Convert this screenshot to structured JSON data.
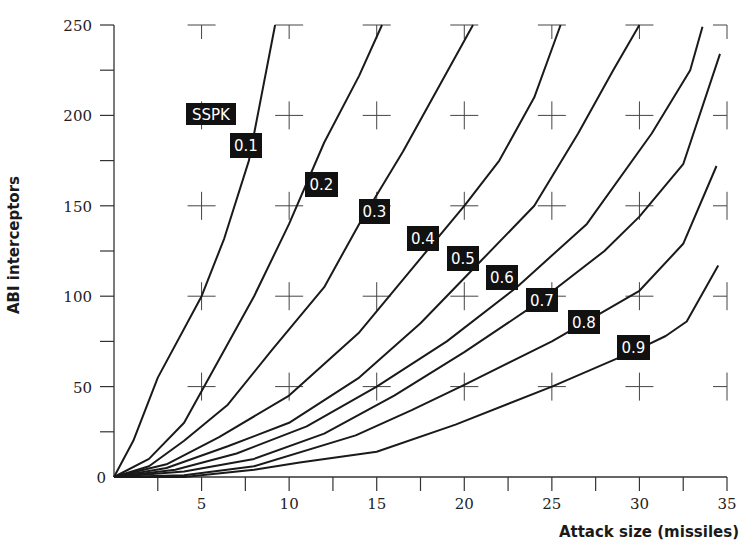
{
  "chart_data": {
    "type": "line",
    "title": "",
    "xlabel": "Attack size (missiles)",
    "ylabel": "ABI interceptors",
    "xlim": [
      0,
      35
    ],
    "ylim": [
      0,
      250
    ],
    "x_ticks": [
      0,
      5,
      10,
      15,
      20,
      25,
      30,
      35
    ],
    "y_ticks": [
      0,
      50,
      100,
      150,
      200,
      250
    ],
    "x_minor_tick_step": 2.5,
    "y_minor_tick_step": 25,
    "grid": "cross markers at major ticks",
    "legend": {
      "title": "SSPK",
      "position": "inline labels on curves"
    },
    "series": [
      {
        "name": "0.1",
        "points": [
          [
            0,
            0
          ],
          [
            1.1,
            20
          ],
          [
            2.5,
            55
          ],
          [
            5,
            100
          ],
          [
            6.3,
            132
          ],
          [
            7.7,
            175
          ],
          [
            9.2,
            250
          ]
        ]
      },
      {
        "name": "0.2",
        "points": [
          [
            0,
            0
          ],
          [
            2,
            10
          ],
          [
            4,
            30
          ],
          [
            6,
            65
          ],
          [
            8,
            100
          ],
          [
            10,
            140
          ],
          [
            12,
            185
          ],
          [
            14,
            222
          ],
          [
            15.3,
            250
          ]
        ]
      },
      {
        "name": "0.3",
        "points": [
          [
            0,
            0
          ],
          [
            2,
            6
          ],
          [
            4,
            20
          ],
          [
            6.5,
            40
          ],
          [
            9,
            70
          ],
          [
            12,
            105
          ],
          [
            14,
            140
          ],
          [
            16.5,
            180
          ],
          [
            18.5,
            215
          ],
          [
            20.5,
            250
          ]
        ]
      },
      {
        "name": "0.4",
        "points": [
          [
            0,
            0
          ],
          [
            3,
            7
          ],
          [
            6,
            22
          ],
          [
            10,
            45
          ],
          [
            14,
            80
          ],
          [
            17,
            115
          ],
          [
            20,
            150
          ],
          [
            22,
            175
          ],
          [
            24,
            210
          ],
          [
            25.5,
            250
          ]
        ]
      },
      {
        "name": "0.5",
        "points": [
          [
            0,
            0
          ],
          [
            3,
            5
          ],
          [
            6.5,
            17
          ],
          [
            10,
            30
          ],
          [
            14,
            55
          ],
          [
            17.5,
            85
          ],
          [
            21,
            120
          ],
          [
            24,
            150
          ],
          [
            26.5,
            190
          ],
          [
            28.5,
            225
          ],
          [
            30,
            250
          ]
        ]
      },
      {
        "name": "0.6",
        "points": [
          [
            0,
            0
          ],
          [
            3.5,
            4
          ],
          [
            7,
            13
          ],
          [
            11,
            28
          ],
          [
            15,
            50
          ],
          [
            19,
            75
          ],
          [
            23,
            105
          ],
          [
            27,
            140
          ],
          [
            30.7,
            190
          ],
          [
            32.9,
            225
          ],
          [
            33.6,
            249
          ]
        ]
      },
      {
        "name": "0.7",
        "points": [
          [
            0,
            0
          ],
          [
            4,
            3
          ],
          [
            8,
            10
          ],
          [
            12,
            24
          ],
          [
            16,
            45
          ],
          [
            20,
            69
          ],
          [
            24,
            95
          ],
          [
            28,
            125
          ],
          [
            30,
            144
          ],
          [
            32.5,
            173
          ],
          [
            34.6,
            234
          ]
        ]
      },
      {
        "name": "0.8",
        "points": [
          [
            0,
            0
          ],
          [
            4,
            1
          ],
          [
            8,
            6
          ],
          [
            13.8,
            23
          ],
          [
            17,
            37
          ],
          [
            20,
            51
          ],
          [
            25,
            75
          ],
          [
            30,
            103
          ],
          [
            32.5,
            129
          ],
          [
            34.4,
            172
          ]
        ]
      },
      {
        "name": "0.9",
        "points": [
          [
            0,
            0
          ],
          [
            4,
            0
          ],
          [
            8,
            4
          ],
          [
            10.6,
            8
          ],
          [
            15,
            14
          ],
          [
            19.5,
            29
          ],
          [
            25,
            50
          ],
          [
            29.8,
            70
          ],
          [
            31.5,
            78
          ],
          [
            32.7,
            86
          ],
          [
            34.5,
            117
          ]
        ]
      }
    ],
    "curve_labels": [
      {
        "text": "SSPK",
        "x": 186,
        "y": 103,
        "w": 50,
        "h": 22
      },
      {
        "text": "0.1",
        "x": 230,
        "y": 133,
        "w": 32,
        "h": 25
      },
      {
        "text": "0.2",
        "x": 305,
        "y": 172,
        "w": 33,
        "h": 25
      },
      {
        "text": "0.3",
        "x": 359,
        "y": 199,
        "w": 31,
        "h": 25
      },
      {
        "text": "0.4",
        "x": 407,
        "y": 226,
        "w": 32,
        "h": 25
      },
      {
        "text": "0.5",
        "x": 447,
        "y": 246,
        "w": 32,
        "h": 25
      },
      {
        "text": "0.6",
        "x": 486,
        "y": 265,
        "w": 32,
        "h": 25
      },
      {
        "text": "0.7",
        "x": 526,
        "y": 288,
        "w": 32,
        "h": 24
      },
      {
        "text": "0.8",
        "x": 568,
        "y": 310,
        "w": 32,
        "h": 24
      },
      {
        "text": "0.9",
        "x": 617,
        "y": 335,
        "w": 33,
        "h": 25
      }
    ]
  },
  "colors": {
    "line": "#1a1a1a",
    "axis": "#333333",
    "label_bg": "#111111",
    "label_fg": "#ffffff",
    "cross": "#444444"
  }
}
